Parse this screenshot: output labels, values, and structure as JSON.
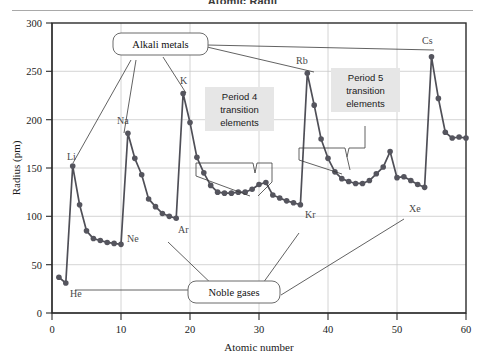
{
  "figure": {
    "title": "Atomic Radii",
    "x_label": "Atomic number",
    "y_label": "Radius (pm)"
  },
  "chart_data": {
    "type": "line",
    "title": "Atomic Radii",
    "xlabel": "Atomic number",
    "ylabel": "Radius (pm)",
    "xlim": [
      0,
      60
    ],
    "ylim": [
      0,
      300
    ],
    "xticks": [
      "0",
      "10",
      "20",
      "30",
      "40",
      "50",
      "60"
    ],
    "yticks": [
      "0",
      "50",
      "100",
      "150",
      "200",
      "250",
      "300"
    ],
    "grid": "vertical and horizontal light gridlines",
    "legend": "none",
    "marker": "filled circle",
    "line_color": "#4f4f57",
    "marker_color": "#55555e",
    "x": [
      1,
      2,
      3,
      4,
      5,
      6,
      7,
      8,
      9,
      10,
      11,
      12,
      13,
      14,
      15,
      16,
      17,
      18,
      19,
      20,
      21,
      22,
      23,
      24,
      25,
      26,
      27,
      28,
      29,
      30,
      31,
      32,
      33,
      34,
      35,
      36,
      37,
      38,
      39,
      40,
      41,
      42,
      43,
      44,
      45,
      46,
      47,
      48,
      49,
      50,
      51,
      52,
      53,
      54,
      55,
      56,
      57,
      58,
      59,
      60
    ],
    "y": [
      37,
      31,
      152,
      112,
      85,
      77,
      75,
      73,
      72,
      71,
      186,
      160,
      143,
      118,
      110,
      103,
      100,
      98,
      227,
      197,
      161,
      145,
      132,
      125,
      124,
      124,
      125,
      125,
      128,
      133,
      135,
      122,
      119,
      116,
      114,
      112,
      248,
      215,
      180,
      160,
      146,
      139,
      136,
      134,
      134,
      137,
      144,
      151,
      167,
      140,
      141,
      137,
      133,
      130,
      265,
      222,
      187,
      181,
      182,
      181,
      169
    ],
    "annotations": [
      {
        "text": "H",
        "atomic_number": 1,
        "radius": 37,
        "shown": false
      },
      {
        "text": "He",
        "atomic_number": 2,
        "radius": 31,
        "shown": true
      },
      {
        "text": "Li",
        "atomic_number": 3,
        "radius": 152,
        "shown": true
      },
      {
        "text": "Ne",
        "atomic_number": 10,
        "radius": 71,
        "shown": true
      },
      {
        "text": "Na",
        "atomic_number": 11,
        "radius": 186,
        "shown": true
      },
      {
        "text": "Ar",
        "atomic_number": 18,
        "radius": 98,
        "shown": true
      },
      {
        "text": "K",
        "atomic_number": 19,
        "radius": 227,
        "shown": true
      },
      {
        "text": "Kr",
        "atomic_number": 36,
        "radius": 112,
        "shown": true
      },
      {
        "text": "Rb",
        "atomic_number": 37,
        "radius": 248,
        "shown": true
      },
      {
        "text": "Xe",
        "atomic_number": 54,
        "radius": 130,
        "shown": true
      },
      {
        "text": "Cs",
        "atomic_number": 55,
        "radius": 265,
        "shown": true
      }
    ]
  },
  "labels": {
    "he": "He",
    "li": "Li",
    "ne": "Ne",
    "na": "Na",
    "ar": "Ar",
    "k": "K",
    "kr": "Kr",
    "rb": "Rb",
    "xe": "Xe",
    "cs": "Cs"
  },
  "callouts": {
    "alkali_metals": "Alkali metals",
    "noble_gases": "Noble gases"
  },
  "notes": {
    "period4": {
      "line1": "Period 4",
      "line2": "transition",
      "line3": "elements"
    },
    "period5": {
      "line1": "Period 5",
      "line2": "transition",
      "line3": "elements"
    }
  },
  "ticks": {
    "x": [
      "0",
      "10",
      "20",
      "30",
      "40",
      "50",
      "60"
    ],
    "y": [
      "0",
      "50",
      "100",
      "150",
      "200",
      "250",
      "300"
    ]
  },
  "colors": {
    "line": "#4f4f57",
    "marker": "#55555e",
    "frame": "#2b2b2b",
    "grid": "#c9c9c9",
    "note_box": "#e9e9e9",
    "callout_box": "#ffffff"
  }
}
